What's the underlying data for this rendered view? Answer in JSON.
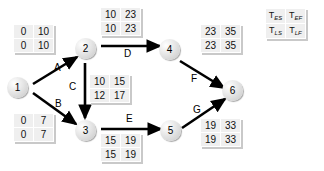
{
  "diagram": {
    "type": "pert-cpm-network"
  },
  "legend": {
    "name": "time-notation-legend",
    "cells": [
      {
        "base": "T",
        "sub": "ES"
      },
      {
        "base": "T",
        "sub": "EF"
      },
      {
        "base": "T",
        "sub": "LS"
      },
      {
        "base": "T",
        "sub": "LF"
      }
    ]
  },
  "nodes": [
    {
      "id": "1",
      "label": "1",
      "x": 17,
      "y": 87
    },
    {
      "id": "2",
      "label": "2",
      "x": 85,
      "y": 48
    },
    {
      "id": "3",
      "label": "3",
      "x": 85,
      "y": 130
    },
    {
      "id": "4",
      "label": "4",
      "x": 169,
      "y": 49
    },
    {
      "id": "5",
      "label": "5",
      "x": 170,
      "y": 130
    },
    {
      "id": "6",
      "label": "6",
      "x": 232,
      "y": 90
    }
  ],
  "edges": [
    {
      "id": "A",
      "label": "A",
      "from": "1",
      "to": "2",
      "label_x": 54,
      "label_y": 68
    },
    {
      "id": "B",
      "label": "B",
      "from": "1",
      "to": "3",
      "label_x": 55,
      "label_y": 104
    },
    {
      "id": "C",
      "label": "C",
      "from": "2",
      "to": "3",
      "label_x": 74,
      "label_y": 86
    },
    {
      "id": "D",
      "label": "D",
      "from": "2",
      "to": "4",
      "label_x": 124,
      "label_y": 54
    },
    {
      "id": "E",
      "label": "E",
      "from": "3",
      "to": "5",
      "label_x": 126,
      "label_y": 119
    },
    {
      "id": "F",
      "label": "F",
      "from": "4",
      "to": "6",
      "label_x": 192,
      "label_y": 79
    },
    {
      "id": "G",
      "label": "G",
      "from": "5",
      "to": "6",
      "label_x": 194,
      "label_y": 110
    }
  ],
  "activity_times": [
    {
      "activity": "A",
      "TES": "0",
      "TEF": "10",
      "TLS": "0",
      "TLF": "10",
      "x": 13,
      "y": 24
    },
    {
      "activity": "B",
      "TES": "0",
      "TEF": "7",
      "TLS": "0",
      "TLF": "7",
      "x": 13,
      "y": 113
    },
    {
      "activity": "C",
      "TES": "10",
      "TEF": "15",
      "TLS": "12",
      "TLF": "17",
      "x": 89,
      "y": 74
    },
    {
      "activity": "D",
      "TES": "10",
      "TEF": "23",
      "TLS": "10",
      "TLF": "23",
      "x": 100,
      "y": 7
    },
    {
      "activity": "E",
      "TES": "15",
      "TEF": "19",
      "TLS": "15",
      "TLF": "19",
      "x": 100,
      "y": 133
    },
    {
      "activity": "F",
      "TES": "23",
      "TEF": "35",
      "TLS": "23",
      "TLF": "35",
      "x": 200,
      "y": 24
    },
    {
      "activity": "G",
      "TES": "19",
      "TEF": "33",
      "TLS": "19",
      "TLF": "33",
      "x": 200,
      "y": 118
    }
  ],
  "colors": {
    "background": "#ffffff",
    "edge": "#000000",
    "table_fill": "#efefef",
    "table_shadow": "#c9c9c9",
    "node_fill": "#e6e6e6"
  }
}
